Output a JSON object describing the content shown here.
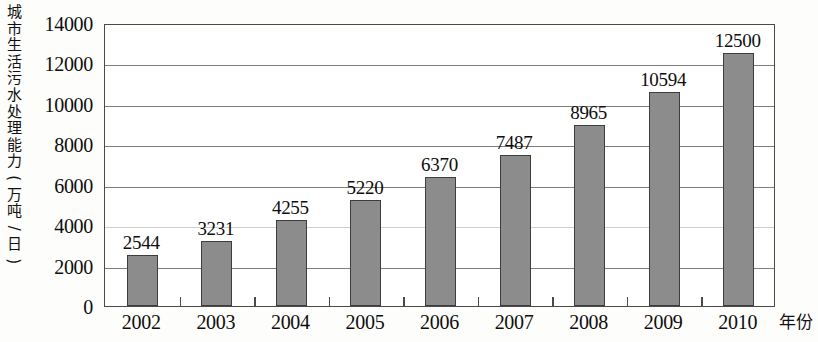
{
  "chart_data": {
    "type": "bar",
    "title": "",
    "subtitle": "",
    "xlabel": "年份",
    "ylabel": "城市生活污水处理能力(万吨/日)",
    "categories": [
      "2002",
      "2003",
      "2004",
      "2005",
      "2006",
      "2007",
      "2008",
      "2009",
      "2010"
    ],
    "values": [
      2544,
      3231,
      4255,
      5220,
      6370,
      7487,
      8965,
      10594,
      12500
    ],
    "data_labels": [
      "2544",
      "3231",
      "4255",
      "5220",
      "6370",
      "7487",
      "8965",
      "10594",
      "12500"
    ],
    "ylim": [
      0,
      14000
    ],
    "ytick_values": [
      0,
      2000,
      4000,
      6000,
      8000,
      10000,
      12000,
      14000
    ],
    "ytick_labels": [
      "0",
      "2000",
      "4000",
      "6000",
      "8000",
      "10000",
      "12000",
      "14000"
    ],
    "grid": true,
    "legend": null,
    "series": [
      {
        "name": "城市生活污水处理能力",
        "values": [
          2544,
          3231,
          4255,
          5220,
          6370,
          7487,
          8965,
          10594,
          12500
        ]
      }
    ],
    "colors": {
      "bar_fill": "#8c8c8c",
      "bar_border": "#3d3d3d",
      "gridline": "#7d7d7d",
      "axis": "#4a4a4a",
      "text": "#0d0d0d",
      "background": "#fdfdfb"
    }
  }
}
